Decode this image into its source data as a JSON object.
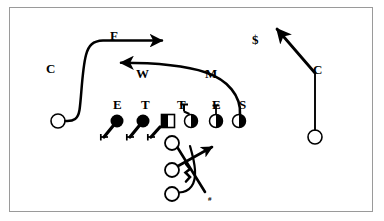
{
  "diagram": {
    "kind": "football-play-diagram",
    "frame": {
      "border_color": "#9a9a9a",
      "background_color": "#ffffff",
      "x": 9,
      "y": 7,
      "width": 364,
      "height": 205
    },
    "ink_color": "#000000",
    "labels": [
      {
        "id": "corner-left",
        "text": "C",
        "x": 46,
        "y": 62,
        "role": "cornerback"
      },
      {
        "id": "free-safety",
        "text": "F",
        "x": 110,
        "y": 29,
        "role": "free-safety"
      },
      {
        "id": "strong-safety",
        "text": "$",
        "x": 252,
        "y": 33,
        "role": "strong-safety"
      },
      {
        "id": "corner-right",
        "text": "C",
        "x": 313,
        "y": 63,
        "role": "cornerback"
      },
      {
        "id": "will-backer",
        "text": "W",
        "x": 136,
        "y": 67,
        "role": "will-linebacker"
      },
      {
        "id": "mike-backer",
        "text": "M",
        "x": 205,
        "y": 67,
        "role": "mike-linebacker"
      },
      {
        "id": "end-left",
        "text": "E",
        "x": 113,
        "y": 98,
        "role": "defensive-end"
      },
      {
        "id": "tackle-left",
        "text": "T",
        "x": 141,
        "y": 98,
        "role": "defensive-tackle"
      },
      {
        "id": "tackle-right",
        "text": "T",
        "x": 177,
        "y": 98,
        "role": "defensive-tackle"
      },
      {
        "id": "end-right",
        "text": "E",
        "x": 212,
        "y": 98,
        "role": "defensive-end"
      },
      {
        "id": "sam-backer",
        "text": "S",
        "x": 239,
        "y": 98,
        "role": "sam-linebacker"
      },
      {
        "id": "motion-mark",
        "text": "#",
        "x": 208,
        "y": 196,
        "role": "motion-marker",
        "size": "small"
      }
    ],
    "defenders": [
      {
        "id": "def-end-left",
        "symbol": "filled-circle",
        "x": 117,
        "y": 121,
        "r": 6.5
      },
      {
        "id": "def-tackle-left",
        "symbol": "filled-circle",
        "x": 143,
        "y": 121,
        "r": 6.5
      },
      {
        "id": "ball-center",
        "symbol": "half-square",
        "x": 168,
        "y": 121,
        "w": 13,
        "h": 13
      },
      {
        "id": "def-tackle-right",
        "symbol": "half-circle",
        "x": 191,
        "y": 121,
        "r": 6.5
      },
      {
        "id": "def-end-right",
        "symbol": "half-circle",
        "x": 216,
        "y": 121,
        "r": 6.5
      },
      {
        "id": "def-sam",
        "symbol": "half-circle",
        "x": 239,
        "y": 121,
        "r": 6.5
      }
    ],
    "offense_backs": [
      {
        "id": "back-top",
        "symbol": "open-circle",
        "x": 172,
        "y": 143,
        "r": 7
      },
      {
        "id": "back-middle",
        "symbol": "open-circle",
        "x": 172,
        "y": 170,
        "r": 7
      },
      {
        "id": "back-bottom",
        "symbol": "open-circle",
        "x": 172,
        "y": 194,
        "r": 7
      }
    ],
    "db_markers": [
      {
        "id": "corner-left-marker",
        "symbol": "open-circle",
        "x": 58,
        "y": 121,
        "r": 7
      },
      {
        "id": "corner-right-marker",
        "symbol": "open-circle",
        "x": 315,
        "y": 137,
        "r": 7
      }
    ],
    "routes": [
      {
        "id": "route-free-safety",
        "from": "corner-left-marker",
        "to": "deep-right",
        "arrow": "right",
        "style": "curved"
      },
      {
        "id": "route-mike-will",
        "from": "def-sam",
        "to": "deep-left",
        "arrow": "left",
        "style": "curved"
      },
      {
        "id": "route-corner-right",
        "from": "corner-right-marker",
        "to": "deep-up-left",
        "arrow": "up-left",
        "style": "angled"
      },
      {
        "id": "stunt-end-left",
        "from": "def-end-left",
        "to": "down-left",
        "arrow": "hook",
        "style": "rush"
      },
      {
        "id": "stunt-tackle-left",
        "from": "def-tackle-left",
        "to": "down-left",
        "arrow": "hook",
        "style": "rush"
      },
      {
        "id": "stunt-center",
        "from": "ball-center",
        "to": "down-left",
        "arrow": "hook",
        "style": "rush"
      },
      {
        "id": "drop-tackle-right",
        "from": "def-tackle-right",
        "to": "up",
        "arrow": "hook",
        "style": "drop"
      },
      {
        "id": "drop-end-right",
        "from": "def-end-right",
        "to": "up",
        "arrow": "none",
        "style": "drop"
      },
      {
        "id": "back-cross-up",
        "from": "back-top",
        "to": "down-right",
        "arrow": "motion",
        "style": "cross"
      },
      {
        "id": "back-cross-mid",
        "from": "back-middle",
        "to": "up-right",
        "arrow": "right",
        "style": "cross"
      },
      {
        "id": "back-swing",
        "from": "back-bottom",
        "to": "up-right",
        "arrow": "none",
        "style": "swing"
      }
    ]
  }
}
